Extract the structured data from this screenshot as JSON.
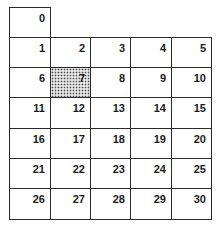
{
  "grid": {
    "title_cell": "0",
    "rows": [
      [
        "1",
        "2",
        "3",
        "4",
        "5"
      ],
      [
        "6",
        "7",
        "8",
        "9",
        "10"
      ],
      [
        "11",
        "12",
        "13",
        "14",
        "15"
      ],
      [
        "16",
        "17",
        "18",
        "19",
        "20"
      ],
      [
        "21",
        "22",
        "23",
        "24",
        "25"
      ],
      [
        "26",
        "27",
        "28",
        "29",
        "30"
      ]
    ],
    "highlighted_cell": "7",
    "highlight_pattern": "dotted-gray"
  }
}
